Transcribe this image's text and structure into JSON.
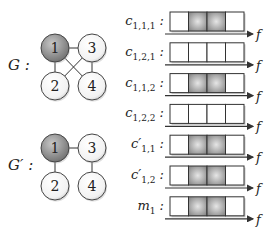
{
  "graphs": [
    {
      "label": "G :",
      "nodes": [
        {
          "id": "1",
          "x": 55,
          "y": 48,
          "highlighted": true
        },
        {
          "id": "3",
          "x": 92,
          "y": 48,
          "highlighted": false
        },
        {
          "id": "2",
          "x": 55,
          "y": 86,
          "highlighted": false
        },
        {
          "id": "4",
          "x": 92,
          "y": 86,
          "highlighted": false
        }
      ],
      "edges": [
        [
          "1",
          "3"
        ],
        [
          "1",
          "2"
        ],
        [
          "3",
          "4"
        ],
        [
          "1",
          "4"
        ],
        [
          "3",
          "2"
        ]
      ]
    },
    {
      "label": "G′ :",
      "nodes": [
        {
          "id": "1",
          "x": 55,
          "y": 148,
          "highlighted": true
        },
        {
          "id": "3",
          "x": 92,
          "y": 148,
          "highlighted": false
        },
        {
          "id": "2",
          "x": 55,
          "y": 186,
          "highlighted": false
        },
        {
          "id": "4",
          "x": 92,
          "y": 186,
          "highlighted": false
        }
      ],
      "edges": [
        [
          "1",
          "3"
        ],
        [
          "1",
          "2"
        ],
        [
          "3",
          "4"
        ]
      ]
    }
  ],
  "rows": [
    {
      "name": "c",
      "sub": "1,1,1",
      "prime": false,
      "cells": [
        0,
        1,
        1,
        0
      ]
    },
    {
      "name": "c",
      "sub": "1,2,1",
      "prime": false,
      "cells": [
        0,
        0,
        0,
        0
      ]
    },
    {
      "name": "c",
      "sub": "1,1,2",
      "prime": false,
      "cells": [
        0,
        1,
        1,
        0
      ]
    },
    {
      "name": "c",
      "sub": "1,2,2",
      "prime": false,
      "cells": [
        0,
        0,
        0,
        0
      ]
    },
    {
      "name": "c",
      "sub": "1,1",
      "prime": true,
      "cells": [
        0,
        1,
        1,
        0
      ]
    },
    {
      "name": "c",
      "sub": "1,2",
      "prime": true,
      "cells": [
        0,
        1,
        1,
        0
      ]
    },
    {
      "name": "m",
      "sub": "1",
      "prime": false,
      "cells": [
        0,
        1,
        1,
        0
      ]
    }
  ],
  "axis_label": "f",
  "colors": {
    "node_highlight": "#8a8a8a",
    "node_plain": "#ffffff",
    "cell_active": "#9a9a9a",
    "line": "#333333"
  }
}
